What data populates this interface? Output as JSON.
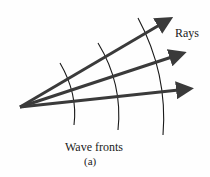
{
  "diagram": {
    "labels": {
      "rays": "Rays",
      "wave_fronts": "Wave fronts",
      "subfigure": "(a)"
    },
    "colors": {
      "ray": "#3a3a3a",
      "wave_front": "#1a1a1a",
      "background": "#fefefe"
    },
    "source_point": [
      20,
      107
    ],
    "rays": [
      {
        "end": [
          173,
          17
        ]
      },
      {
        "end": [
          186,
          52
        ]
      },
      {
        "end": [
          193,
          89
        ]
      }
    ],
    "wave_fronts": [
      {
        "top": [
          60,
          63
        ],
        "bottom": [
          74,
          125
        ]
      },
      {
        "top": [
          98,
          43
        ],
        "bottom": [
          118,
          130
        ]
      },
      {
        "top": [
          138,
          18
        ],
        "bottom": [
          163,
          135
        ]
      }
    ]
  }
}
